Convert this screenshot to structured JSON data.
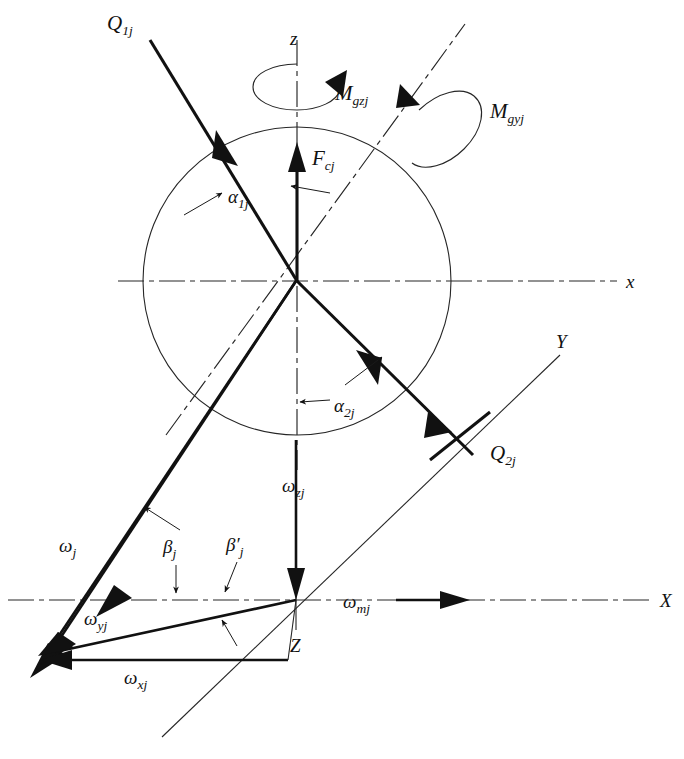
{
  "figure": {
    "background_color": "#ffffff",
    "line_color": "#111111",
    "width": 684,
    "height": 759
  },
  "axes": {
    "z_upper": "z",
    "x_upper": "x",
    "Y_global": "Y",
    "X_global": "X",
    "Z_lower": "Z"
  },
  "forces": {
    "q1j": "Q",
    "q1j_sub": "1j",
    "q2j": "Q",
    "q2j_sub": "2j",
    "fcj": "F",
    "fcj_sub": "cj"
  },
  "moments": {
    "mgzj": "M",
    "mgzj_sub": "gzj",
    "mgyj": "M",
    "mgyj_sub": "gyj"
  },
  "angles": {
    "alpha1j": "α",
    "alpha1j_sub": "1j",
    "alpha2j": "α",
    "alpha2j_sub": "2j",
    "betaj": "β",
    "betaj_sub": "j",
    "betaj_prime": "β′",
    "betaj_prime_sub": "j"
  },
  "velocities": {
    "omega_j": "ω",
    "omega_j_sub": "j",
    "omega_xj": "ω",
    "omega_xj_sub": "xj",
    "omega_yj": "ω",
    "omega_yj_sub": "yj",
    "omega_zj": "ω",
    "omega_zj_sub": "zj",
    "omega_mj": "ω",
    "omega_mj_sub": "mj"
  },
  "geometry": {
    "ball_center_x": 297,
    "ball_center_y": 281,
    "ball_radius": 154,
    "lower_origin_x": 296,
    "lower_origin_y": 600
  }
}
